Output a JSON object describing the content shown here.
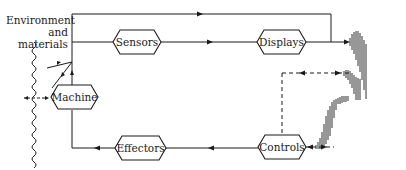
{
  "diagram": {
    "environment_label_line1": "Environment",
    "environment_label_line2": "and materials",
    "nodes": {
      "machine": "Machine",
      "sensors": "Sensors",
      "displays": "Displays",
      "effectors": "Effectors",
      "controls": "Controls"
    },
    "colors": {
      "stroke": "#1a1a1a",
      "background": "#ffffff"
    },
    "icons": {
      "environment_boundary": "wavy-line-icon",
      "human_operator": "hatched-figure-icon"
    }
  }
}
